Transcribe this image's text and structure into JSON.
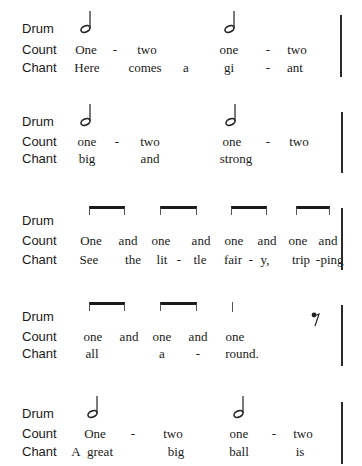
{
  "row_labels": {
    "drum": "Drum",
    "count": "Count",
    "chant": "Chant"
  },
  "sections": [
    {
      "drum": [
        "half-note",
        "half-note"
      ],
      "count": [
        "One",
        "-",
        "two",
        "one",
        "-",
        "two"
      ],
      "chant": [
        "Here",
        "comes",
        "a",
        "gi",
        "-",
        "ant"
      ]
    },
    {
      "drum": [
        "half-note",
        "half-note"
      ],
      "count": [
        "one",
        "-",
        "two",
        "one",
        "-",
        "two"
      ],
      "chant": [
        "big",
        "and",
        "strong"
      ]
    },
    {
      "drum": [
        "eighth-pair",
        "eighth-pair",
        "eighth-pair",
        "eighth-pair"
      ],
      "count": [
        "One",
        "and",
        "one",
        "and",
        "one",
        "and",
        "one",
        "and"
      ],
      "chant": [
        "See",
        "the",
        "lit",
        "-",
        "tle",
        "fair",
        "-",
        "y,",
        "trip",
        "-",
        "ping"
      ]
    },
    {
      "drum": [
        "eighth-pair",
        "eighth-pair",
        "quarter-stem",
        "eighth-rest"
      ],
      "count": [
        "one",
        "and",
        "one",
        "and",
        "one"
      ],
      "chant": [
        "all",
        "a",
        "-",
        "round."
      ]
    },
    {
      "drum": [
        "half-note",
        "half-note"
      ],
      "count": [
        "One",
        "-",
        "two",
        "one",
        "-",
        "two"
      ],
      "chant": [
        "A",
        "great",
        "big",
        "ball",
        "is"
      ]
    }
  ]
}
